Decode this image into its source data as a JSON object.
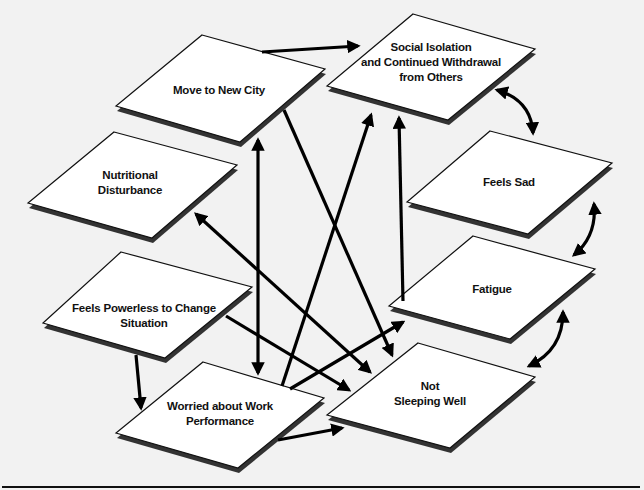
{
  "diagram": {
    "nodes": [
      {
        "id": "move",
        "lines": [
          "Move to New City"
        ],
        "label_x": 219,
        "label_y": 90,
        "points": [
          [
            202,
            35
          ],
          [
            325,
            69
          ],
          [
            240,
            142
          ],
          [
            116,
            106
          ]
        ]
      },
      {
        "id": "isolation",
        "lines": [
          "Social Isolation",
          "and Continued Withdrawal",
          "from Others"
        ],
        "label_x": 431,
        "label_y": 62,
        "points": [
          [
            413,
            14
          ],
          [
            535,
            49
          ],
          [
            448,
            120
          ],
          [
            327,
            86
          ]
        ]
      },
      {
        "id": "nutrition",
        "lines": [
          "Nutritional",
          "Disturbance"
        ],
        "label_x": 130,
        "label_y": 183,
        "points": [
          [
            114,
            132
          ],
          [
            237,
            165
          ],
          [
            152,
            238
          ],
          [
            28,
            203
          ]
        ]
      },
      {
        "id": "sad",
        "lines": [
          "Feels Sad"
        ],
        "label_x": 509,
        "label_y": 182,
        "points": [
          [
            490,
            131
          ],
          [
            612,
            163
          ],
          [
            528,
            234
          ],
          [
            407,
            202
          ]
        ]
      },
      {
        "id": "powerless",
        "lines": [
          "Feels Powerless to Change",
          "Situation"
        ],
        "label_x": 144,
        "label_y": 316,
        "points": [
          [
            121,
            252
          ],
          [
            252,
            287
          ],
          [
            165,
            358
          ],
          [
            43,
            323
          ]
        ]
      },
      {
        "id": "fatigue",
        "lines": [
          "Fatigue"
        ],
        "label_x": 492,
        "label_y": 289,
        "points": [
          [
            473,
            236
          ],
          [
            595,
            269
          ],
          [
            510,
            339
          ],
          [
            389,
            306
          ]
        ]
      },
      {
        "id": "worried",
        "lines": [
          "Worried about Work",
          "Performance"
        ],
        "label_x": 220,
        "label_y": 414,
        "points": [
          [
            203,
            362
          ],
          [
            324,
            398
          ],
          [
            238,
            468
          ],
          [
            116,
            433
          ]
        ]
      },
      {
        "id": "sleep",
        "lines": [
          "Not",
          "Sleeping Well"
        ],
        "label_x": 430,
        "label_y": 394,
        "points": [
          [
            418,
            343
          ],
          [
            535,
            377
          ],
          [
            450,
            448
          ],
          [
            327,
            415
          ]
        ]
      }
    ],
    "edges": [
      {
        "from": "move",
        "to": "isolation",
        "type": "single",
        "x1": 262,
        "y1": 52,
        "x2": 358,
        "y2": 46
      },
      {
        "from": "move",
        "to": "sleep",
        "type": "single",
        "x1": 284,
        "y1": 110,
        "x2": 392,
        "y2": 355
      },
      {
        "from": "move",
        "to": "worried",
        "type": "double",
        "x1": 258,
        "y1": 140,
        "x2": 258,
        "y2": 373
      },
      {
        "from": "worried",
        "to": "isolation",
        "type": "single",
        "x1": 282,
        "y1": 386,
        "x2": 371,
        "y2": 115
      },
      {
        "from": "fatigue",
        "to": "isolation",
        "type": "single",
        "x1": 403,
        "y1": 301,
        "x2": 399,
        "y2": 118
      },
      {
        "from": "nutrition",
        "to": "sleep",
        "type": "double",
        "x1": 196,
        "y1": 214,
        "x2": 370,
        "y2": 372
      },
      {
        "from": "powerless",
        "to": "sleep",
        "type": "single",
        "x1": 226,
        "y1": 316,
        "x2": 349,
        "y2": 390
      },
      {
        "from": "worried",
        "to": "fatigue",
        "type": "single",
        "x1": 290,
        "y1": 389,
        "x2": 403,
        "y2": 322
      },
      {
        "from": "powerless",
        "to": "worried",
        "type": "single",
        "x1": 136,
        "y1": 355,
        "x2": 141,
        "y2": 408
      },
      {
        "from": "worried",
        "to": "sleep",
        "type": "single",
        "x1": 278,
        "y1": 440,
        "x2": 342,
        "y2": 428
      },
      {
        "from": "isolation",
        "to": "sad",
        "type": "double-curve",
        "x1": 497,
        "y1": 90,
        "x2": 533,
        "y2": 133,
        "cx": 531,
        "cy": 100
      },
      {
        "from": "sad",
        "to": "fatigue",
        "type": "double-curve",
        "x1": 594,
        "y1": 204,
        "x2": 574,
        "y2": 255,
        "cx": 597,
        "cy": 236
      },
      {
        "from": "fatigue",
        "to": "sleep",
        "type": "double-curve",
        "x1": 563,
        "y1": 312,
        "x2": 529,
        "y2": 366,
        "cx": 563,
        "cy": 350
      }
    ],
    "colors": {
      "background": "#f2f2f2",
      "node_fill": "#ffffff",
      "node_stroke": "#111111",
      "shadow": "#333333",
      "arrow": "#000000"
    },
    "footer_rule": {
      "x1": 2,
      "x2": 640,
      "y": 487
    }
  }
}
